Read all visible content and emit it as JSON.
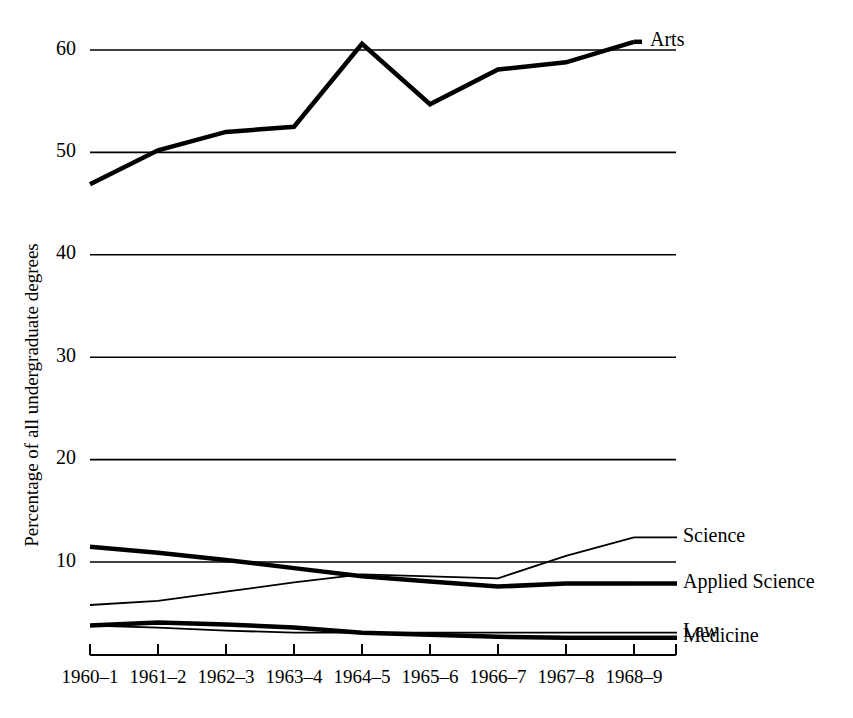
{
  "chart_data": {
    "type": "line",
    "title": "",
    "xlabel": "",
    "ylabel": "Percentage of all undergraduate degrees",
    "categories": [
      "1960–1",
      "1961–2",
      "1962–3",
      "1963–4",
      "1964–5",
      "1965–6",
      "1966–7",
      "1967–8",
      "1968–9"
    ],
    "x": [
      0,
      1,
      2,
      3,
      4,
      5,
      6,
      7,
      8
    ],
    "ylim": [
      0,
      64
    ],
    "xlim": [
      0,
      8
    ],
    "yticks": [
      10,
      20,
      30,
      40,
      50,
      60
    ],
    "ytick_labels": [
      "10",
      "20",
      "30",
      "40",
      "50",
      "60"
    ],
    "grid": "horizontal-only",
    "legend": "right-of-line-ends",
    "series": [
      {
        "name": "Arts",
        "label": "Arts",
        "stroke_width": 4.5,
        "color": "#000000",
        "values": [
          46.9,
          50.2,
          52.0,
          52.5,
          60.6,
          54.7,
          58.1,
          58.8,
          60.8
        ]
      },
      {
        "name": "Science",
        "label": "Science",
        "stroke_width": 1.8,
        "color": "#000000",
        "values": [
          5.8,
          6.2,
          7.1,
          8.0,
          8.8,
          8.6,
          8.4,
          10.6,
          12.4
        ]
      },
      {
        "name": "Applied Science",
        "label": "Applied Science",
        "stroke_width": 4.5,
        "color": "#000000",
        "values": [
          11.5,
          10.9,
          10.2,
          9.4,
          8.6,
          8.1,
          7.6,
          7.9,
          7.9
        ]
      },
      {
        "name": "Law",
        "label": "Law",
        "stroke_width": 1.8,
        "color": "#000000",
        "values": [
          3.8,
          3.6,
          3.3,
          3.1,
          3.1,
          3.1,
          3.1,
          3.1,
          3.1
        ]
      },
      {
        "name": "Medicine",
        "label": "Medicine",
        "stroke_width": 4.5,
        "color": "#000000",
        "values": [
          3.8,
          4.1,
          3.9,
          3.6,
          3.1,
          2.9,
          2.7,
          2.6,
          2.6
        ]
      }
    ]
  },
  "figure": {
    "background": "#ffffff",
    "ink": "#000000"
  }
}
